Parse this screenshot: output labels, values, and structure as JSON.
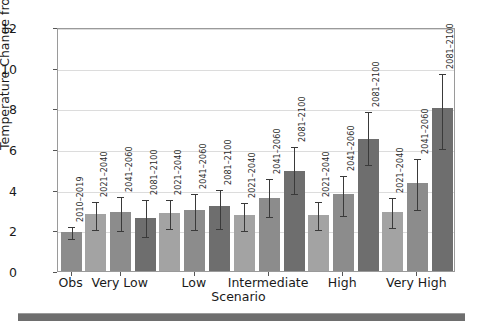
{
  "chart_data": {
    "type": "bar",
    "title": "",
    "subtitle": "",
    "xlabel": "Scenario",
    "ylabel": "Temperature Change from 1850–1900 (°F)",
    "ylim": [
      0,
      12
    ],
    "yticks": [
      0,
      2,
      4,
      6,
      8,
      10,
      12
    ],
    "grid": true,
    "legend": "none",
    "categories": [
      "Obs",
      "Very Low",
      "Low",
      "Intermediate",
      "High",
      "Very High"
    ],
    "period_labels": [
      "2010–2019",
      "2021–2040",
      "2041–2060",
      "2081–2100"
    ],
    "groups": [
      {
        "category": "Obs",
        "bars": [
          {
            "period": "2010–2019",
            "value": 1.9,
            "err_low": 1.65,
            "err_high": 2.25,
            "color": "#8c8c8c"
          }
        ]
      },
      {
        "category": "Very Low",
        "bars": [
          {
            "period": "2021–2040",
            "value": 2.8,
            "err_low": 2.1,
            "err_high": 3.5,
            "color": "#a3a3a3"
          },
          {
            "period": "2041–2060",
            "value": 2.9,
            "err_low": 2.05,
            "err_high": 3.75,
            "color": "#8c8c8c"
          },
          {
            "period": "2081–2100",
            "value": 2.6,
            "err_low": 1.75,
            "err_high": 3.6,
            "color": "#6e6e6e"
          }
        ]
      },
      {
        "category": "Low",
        "bars": [
          {
            "period": "2021–2040",
            "value": 2.85,
            "err_low": 2.15,
            "err_high": 3.6,
            "color": "#a3a3a3"
          },
          {
            "period": "2041–2060",
            "value": 3.0,
            "err_low": 2.1,
            "err_high": 3.9,
            "color": "#8c8c8c"
          },
          {
            "period": "2081–2100",
            "value": 3.2,
            "err_low": 2.15,
            "err_high": 4.1,
            "color": "#6e6e6e"
          }
        ]
      },
      {
        "category": "Intermediate",
        "bars": [
          {
            "period": "2021–2040",
            "value": 2.75,
            "err_low": 2.05,
            "err_high": 3.45,
            "color": "#a3a3a3"
          },
          {
            "period": "2041–2060",
            "value": 3.6,
            "err_low": 2.75,
            "err_high": 4.6,
            "color": "#8c8c8c"
          },
          {
            "period": "2081–2100",
            "value": 4.9,
            "err_low": 3.9,
            "err_high": 6.2,
            "color": "#6e6e6e"
          }
        ]
      },
      {
        "category": "High",
        "bars": [
          {
            "period": "2021–2040",
            "value": 2.75,
            "err_low": 2.1,
            "err_high": 3.5,
            "color": "#a3a3a3"
          },
          {
            "period": "2041–2060",
            "value": 3.8,
            "err_low": 2.8,
            "err_high": 4.75,
            "color": "#8c8c8c"
          },
          {
            "period": "2081–2100",
            "value": 6.5,
            "err_low": 5.3,
            "err_high": 7.9,
            "color": "#6e6e6e"
          }
        ]
      },
      {
        "category": "Very High",
        "bars": [
          {
            "period": "2021–2040",
            "value": 2.9,
            "err_low": 2.2,
            "err_high": 3.7,
            "color": "#a3a3a3"
          },
          {
            "period": "2041–2060",
            "value": 4.35,
            "err_low": 3.1,
            "err_high": 5.6,
            "color": "#8c8c8c"
          },
          {
            "period": "2081–2100",
            "value": 8.0,
            "err_low": 6.1,
            "err_high": 9.8,
            "color": "#6e6e6e"
          }
        ]
      }
    ]
  },
  "colors": {
    "near_term": "#a3a3a3",
    "mid_term": "#8c8c8c",
    "long_term": "#6e6e6e",
    "axis": "#9a9a9a",
    "grid": "#dcdcdc",
    "text": "#1a1a1a",
    "band": "#6e6e6e"
  }
}
